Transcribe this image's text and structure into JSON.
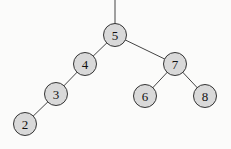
{
  "diagram": {
    "type": "binary-search-tree",
    "root_edge": {
      "x1": 115,
      "y1": 0,
      "x2": 115,
      "y2": 24
    },
    "nodes": [
      {
        "id": "n5",
        "label": "5",
        "x": 115,
        "y": 35
      },
      {
        "id": "n4",
        "label": "4",
        "x": 85,
        "y": 64
      },
      {
        "id": "n7",
        "label": "7",
        "x": 175,
        "y": 64
      },
      {
        "id": "n3",
        "label": "3",
        "x": 56,
        "y": 94
      },
      {
        "id": "n6",
        "label": "6",
        "x": 145,
        "y": 96
      },
      {
        "id": "n8",
        "label": "8",
        "x": 205,
        "y": 96
      },
      {
        "id": "n2",
        "label": "2",
        "x": 25,
        "y": 124
      }
    ],
    "edges": [
      {
        "from": "n5",
        "to": "n4"
      },
      {
        "from": "n5",
        "to": "n7"
      },
      {
        "from": "n4",
        "to": "n3"
      },
      {
        "from": "n3",
        "to": "n2"
      },
      {
        "from": "n7",
        "to": "n6"
      },
      {
        "from": "n7",
        "to": "n8"
      }
    ],
    "node_radius": 11.5,
    "node_fill": "#d9d9d9",
    "stroke_color": "#333333"
  }
}
